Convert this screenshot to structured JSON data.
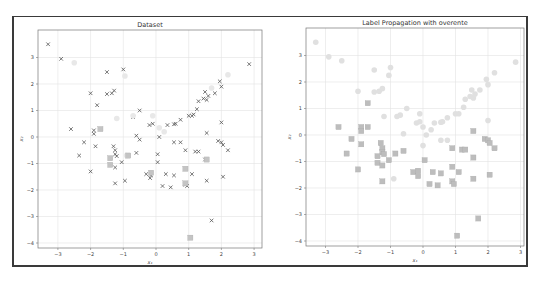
{
  "chart_data": [
    {
      "type": "scatter",
      "title": "Dataset",
      "xlabel": "x₁",
      "ylabel": "x₂",
      "xlim": [
        -3.5,
        3.2
      ],
      "ylim": [
        -4.2,
        3.9
      ],
      "xticks": [
        -3,
        -2,
        -1,
        0,
        1,
        2,
        3
      ],
      "yticks": [
        -4,
        -3,
        -2,
        -1,
        0,
        1,
        2,
        3
      ],
      "grid": true,
      "series": [
        {
          "name": "labeled class A (x)",
          "marker": "x",
          "color": "#555555",
          "points": [
            [
              -3.3,
              3.5
            ],
            [
              -2.9,
              2.95
            ],
            [
              -1.5,
              2.45
            ],
            [
              -1.0,
              2.55
            ],
            [
              -2.0,
              1.65
            ],
            [
              -1.5,
              1.62
            ],
            [
              -1.35,
              1.65
            ],
            [
              -1.28,
              1.75
            ],
            [
              -1.8,
              1.2
            ],
            [
              -0.7,
              0.75
            ],
            [
              -0.5,
              1.0
            ],
            [
              -2.6,
              0.3
            ],
            [
              -1.9,
              0.25
            ],
            [
              -1.9,
              0.12
            ],
            [
              -0.2,
              0.45
            ],
            [
              -0.1,
              0.5
            ],
            [
              -0.6,
              0.05
            ],
            [
              0.1,
              0.0
            ],
            [
              0.35,
              0.45
            ],
            [
              0.55,
              0.48
            ],
            [
              0.6,
              0.5
            ],
            [
              0.75,
              0.65
            ],
            [
              1.0,
              0.8
            ],
            [
              1.1,
              0.8
            ],
            [
              1.15,
              0.85
            ],
            [
              1.25,
              1.05
            ],
            [
              1.3,
              1.35
            ],
            [
              1.45,
              1.45
            ],
            [
              1.55,
              1.4
            ],
            [
              1.5,
              1.7
            ],
            [
              1.6,
              1.55
            ],
            [
              1.8,
              1.65
            ],
            [
              1.95,
              2.1
            ],
            [
              2.0,
              1.9
            ],
            [
              2.85,
              2.75
            ],
            [
              2.0,
              0.55
            ],
            [
              1.55,
              0.15
            ],
            [
              1.9,
              -0.15
            ],
            [
              2.0,
              -0.2
            ],
            [
              2.05,
              -0.3
            ],
            [
              -0.5,
              -0.1
            ]
          ]
        },
        {
          "name": "labeled class B (x)",
          "marker": "x",
          "color": "#555555",
          "points": [
            [
              -2.2,
              -0.2
            ],
            [
              -1.85,
              -0.35
            ],
            [
              -1.3,
              -0.35
            ],
            [
              -1.25,
              -0.5
            ],
            [
              -1.25,
              -0.65
            ],
            [
              -1.2,
              -0.72
            ],
            [
              -1.05,
              -0.95
            ],
            [
              -1.25,
              -1.15
            ],
            [
              -2.35,
              -0.7
            ],
            [
              -2.0,
              -1.3
            ],
            [
              -0.6,
              -0.6
            ],
            [
              0.05,
              -0.65
            ],
            [
              0.05,
              -0.95
            ],
            [
              0.55,
              -0.2
            ],
            [
              0.75,
              -0.2
            ],
            [
              0.9,
              -0.5
            ],
            [
              1.2,
              -0.55
            ],
            [
              1.3,
              -0.55
            ],
            [
              2.2,
              -0.5
            ],
            [
              1.5,
              -0.85
            ],
            [
              -0.3,
              -1.4
            ],
            [
              -0.15,
              -1.45
            ],
            [
              -0.18,
              -1.55
            ],
            [
              0.3,
              -1.4
            ],
            [
              0.55,
              -1.45
            ],
            [
              1.1,
              -1.4
            ],
            [
              1.55,
              -1.65
            ],
            [
              2.05,
              -1.5
            ],
            [
              -1.25,
              -1.75
            ],
            [
              -0.95,
              -1.65
            ],
            [
              0.2,
              -1.85
            ],
            [
              0.45,
              -1.9
            ],
            [
              0.9,
              -1.8
            ],
            [
              0.95,
              -1.85
            ],
            [
              1.7,
              -3.15
            ]
          ]
        },
        {
          "name": "unlabeled",
          "marker": "o",
          "color": "#e8e8e8",
          "points": [
            [
              -2.5,
              2.8
            ],
            [
              -0.95,
              2.3
            ],
            [
              -1.2,
              0.7
            ],
            [
              -0.7,
              0.8
            ],
            [
              -0.1,
              0.8
            ],
            [
              0.1,
              0.35
            ],
            [
              0.25,
              0.2
            ],
            [
              2.2,
              2.35
            ],
            [
              1.7,
              1.85
            ],
            [
              -0.9,
              -0.7
            ]
          ]
        },
        {
          "name": "labeled class B (square)",
          "marker": "s",
          "color": "#c4c4c4",
          "points": [
            [
              -1.7,
              0.3
            ],
            [
              -1.4,
              -0.8
            ],
            [
              -1.4,
              -1.05
            ],
            [
              -0.85,
              -0.7
            ],
            [
              -0.15,
              -1.35
            ],
            [
              0.9,
              -1.2
            ],
            [
              0.9,
              -1.75
            ],
            [
              1.05,
              -3.8
            ],
            [
              1.55,
              -0.85
            ]
          ]
        }
      ]
    },
    {
      "type": "scatter",
      "title": "Label Propagation with overente",
      "xlabel": "x₁",
      "ylabel": "x₂",
      "xlim": [
        -3.5,
        3.2
      ],
      "ylim": [
        -4.2,
        3.9
      ],
      "xticks": [
        -3,
        -2,
        -1,
        0,
        1,
        2,
        3
      ],
      "yticks": [
        -4,
        -3,
        -2,
        -1,
        0,
        1,
        2,
        3
      ],
      "grid": true,
      "series": [
        {
          "name": "class A (circle)",
          "marker": "o",
          "color": "#e0e0e0",
          "points": [
            [
              -3.3,
              3.5
            ],
            [
              -2.9,
              2.95
            ],
            [
              -2.5,
              2.8
            ],
            [
              -1.5,
              2.45
            ],
            [
              -1.0,
              2.55
            ],
            [
              -1.05,
              2.25
            ],
            [
              -2.0,
              1.65
            ],
            [
              -1.5,
              1.62
            ],
            [
              -1.35,
              1.65
            ],
            [
              -1.25,
              1.75
            ],
            [
              -1.2,
              0.7
            ],
            [
              -0.7,
              0.75
            ],
            [
              -0.5,
              1.0
            ],
            [
              -0.8,
              0.7
            ],
            [
              -0.1,
              0.8
            ],
            [
              -0.2,
              0.45
            ],
            [
              -0.1,
              0.5
            ],
            [
              -0.6,
              0.05
            ],
            [
              0.0,
              0.3
            ],
            [
              0.1,
              0.0
            ],
            [
              0.25,
              0.2
            ],
            [
              0.35,
              0.45
            ],
            [
              0.55,
              0.48
            ],
            [
              0.6,
              0.5
            ],
            [
              0.75,
              0.65
            ],
            [
              1.0,
              0.8
            ],
            [
              1.1,
              0.8
            ],
            [
              1.25,
              1.05
            ],
            [
              1.3,
              1.35
            ],
            [
              1.45,
              1.45
            ],
            [
              1.55,
              1.4
            ],
            [
              1.5,
              1.7
            ],
            [
              1.6,
              1.55
            ],
            [
              1.75,
              1.7
            ],
            [
              1.95,
              2.1
            ],
            [
              2.0,
              1.9
            ],
            [
              2.2,
              2.35
            ],
            [
              2.85,
              2.75
            ],
            [
              2.0,
              0.55
            ],
            [
              0.55,
              -0.2
            ],
            [
              0.75,
              -0.2
            ],
            [
              0.0,
              -0.4
            ],
            [
              -0.9,
              -1.65
            ]
          ]
        },
        {
          "name": "class B (square)",
          "marker": "s",
          "color": "#bdbdbd",
          "points": [
            [
              -1.7,
              1.2
            ],
            [
              -2.6,
              0.3
            ],
            [
              -1.9,
              0.3
            ],
            [
              -1.9,
              0.15
            ],
            [
              -1.7,
              0.3
            ],
            [
              -2.2,
              -0.15
            ],
            [
              -1.9,
              -0.35
            ],
            [
              -1.3,
              -0.3
            ],
            [
              -1.25,
              -0.5
            ],
            [
              -1.25,
              -0.65
            ],
            [
              -1.2,
              -0.72
            ],
            [
              -1.05,
              -0.95
            ],
            [
              -1.4,
              -0.8
            ],
            [
              -1.4,
              -1.05
            ],
            [
              -1.25,
              -1.15
            ],
            [
              -0.85,
              -0.7
            ],
            [
              -2.35,
              -0.7
            ],
            [
              -2.0,
              -1.3
            ],
            [
              -0.6,
              -0.6
            ],
            [
              0.05,
              -0.95
            ],
            [
              0.9,
              -0.5
            ],
            [
              1.2,
              -0.55
            ],
            [
              1.3,
              -0.55
            ],
            [
              1.55,
              -0.85
            ],
            [
              1.55,
              0.15
            ],
            [
              1.9,
              -0.15
            ],
            [
              2.0,
              -0.2
            ],
            [
              2.05,
              -0.3
            ],
            [
              2.2,
              -0.5
            ],
            [
              -0.3,
              -1.4
            ],
            [
              -0.15,
              -1.35
            ],
            [
              -0.15,
              -1.55
            ],
            [
              0.3,
              -1.4
            ],
            [
              0.55,
              -1.45
            ],
            [
              0.9,
              -1.2
            ],
            [
              1.1,
              -1.4
            ],
            [
              1.55,
              -1.65
            ],
            [
              2.05,
              -1.5
            ],
            [
              -1.25,
              -1.75
            ],
            [
              0.2,
              -1.85
            ],
            [
              0.45,
              -1.9
            ],
            [
              0.9,
              -1.75
            ],
            [
              0.95,
              -1.85
            ],
            [
              1.7,
              -3.15
            ],
            [
              1.05,
              -3.8
            ]
          ]
        }
      ]
    }
  ],
  "layout": {
    "panels": [
      {
        "left": 38,
        "top": 30,
        "right": 262,
        "bottom": 248,
        "x0px": 156,
        "xscale": 32.7,
        "y0px": 137,
        "yscale": 26.5
      },
      {
        "left": 306,
        "top": 28,
        "right": 524,
        "bottom": 246,
        "x0px": 423,
        "xscale": 32.5,
        "y0px": 135,
        "yscale": 26.5
      }
    ],
    "colors": {
      "grid": "#e3e3e3",
      "axis": "#777777",
      "frame": "#333333"
    }
  }
}
